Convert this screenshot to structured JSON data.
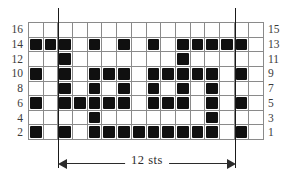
{
  "chart_data": {
    "type": "heatmap",
    "title": "",
    "xlabel": "12 sts",
    "ylabel": "",
    "grid": true,
    "columns": 16,
    "rows": 8,
    "legend": [],
    "repeat": {
      "label": "12 sts",
      "start_column": 3,
      "end_column": 14,
      "width_in_stitches": 12
    },
    "categories": [
      "1",
      "2",
      "3",
      "4",
      "5",
      "6",
      "7",
      "8",
      "9",
      "10",
      "11",
      "12",
      "13",
      "14",
      "15",
      "16"
    ],
    "row_labels_left": [
      "16",
      "14",
      "12",
      "10",
      "8",
      "6",
      "4",
      "2"
    ],
    "row_labels_right": [
      "15",
      "13",
      "11",
      "9",
      "7",
      "5",
      "3",
      "1"
    ],
    "cells": [
      {
        "row_left": "16",
        "row_right": "15",
        "filled": [
          0,
          0,
          0,
          0,
          0,
          0,
          0,
          0,
          0,
          0,
          0,
          0,
          0,
          0,
          0,
          0
        ]
      },
      {
        "row_left": "14",
        "row_right": "13",
        "filled": [
          1,
          1,
          1,
          0,
          1,
          0,
          1,
          0,
          1,
          0,
          1,
          1,
          1,
          1,
          1,
          0
        ]
      },
      {
        "row_left": "12",
        "row_right": "11",
        "filled": [
          0,
          0,
          1,
          0,
          0,
          0,
          0,
          0,
          0,
          0,
          1,
          0,
          0,
          0,
          0,
          0
        ]
      },
      {
        "row_left": "10",
        "row_right": "9",
        "filled": [
          1,
          0,
          1,
          0,
          1,
          1,
          1,
          0,
          1,
          1,
          1,
          1,
          1,
          0,
          1,
          0
        ]
      },
      {
        "row_left": "8",
        "row_right": "7",
        "filled": [
          0,
          0,
          1,
          0,
          1,
          0,
          1,
          0,
          1,
          0,
          1,
          0,
          1,
          0,
          0,
          0
        ]
      },
      {
        "row_left": "6",
        "row_right": "5",
        "filled": [
          1,
          0,
          1,
          1,
          1,
          1,
          1,
          0,
          1,
          1,
          1,
          0,
          1,
          0,
          1,
          0
        ]
      },
      {
        "row_left": "4",
        "row_right": "3",
        "filled": [
          0,
          0,
          0,
          0,
          1,
          0,
          0,
          0,
          0,
          0,
          0,
          0,
          1,
          0,
          0,
          0
        ]
      },
      {
        "row_left": "2",
        "row_right": "1",
        "filled": [
          1,
          0,
          1,
          0,
          1,
          1,
          1,
          1,
          1,
          1,
          1,
          1,
          1,
          0,
          1,
          0
        ]
      }
    ]
  },
  "annotation": {
    "sts_label": "12 sts"
  }
}
